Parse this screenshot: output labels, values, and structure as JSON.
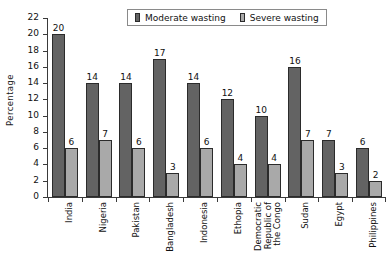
{
  "chart_data": {
    "type": "bar",
    "title": "",
    "xlabel": "",
    "ylabel": "Percentage",
    "ylim": [
      0,
      22
    ],
    "ytick_step": 2,
    "yticks": [
      22,
      20,
      18,
      16,
      14,
      12,
      10,
      8,
      6,
      4,
      2,
      0
    ],
    "grid": false,
    "legend_position": "top-center",
    "categories": [
      "India",
      "Nigeria",
      "Pakistan",
      "Bangladesh",
      "Indonesia",
      "Ethopia",
      "Democratic Republic of the Congo",
      "Sudan",
      "Egypt",
      "Philippines"
    ],
    "category_label_lines": [
      [
        "India"
      ],
      [
        "Nigeria"
      ],
      [
        "Pakistan"
      ],
      [
        "Bangladesh"
      ],
      [
        "Indonesia"
      ],
      [
        "Ethopia"
      ],
      [
        "Democratic",
        "Republic of",
        "the Congo"
      ],
      [
        "Sudan"
      ],
      [
        "Egypt"
      ],
      [
        "Philippines"
      ]
    ],
    "series": [
      {
        "name": "Moderate wasting",
        "color": "#636363",
        "values": [
          20,
          14,
          14,
          17,
          14,
          12,
          10,
          16,
          7,
          6
        ]
      },
      {
        "name": "Severe wasting",
        "color": "#a9a9a9",
        "values": [
          6,
          7,
          6,
          3,
          6,
          4,
          4,
          7,
          3,
          2
        ]
      }
    ]
  },
  "legend": {
    "items": [
      {
        "label": "Moderate wasting"
      },
      {
        "label": "Severe wasting"
      }
    ]
  }
}
